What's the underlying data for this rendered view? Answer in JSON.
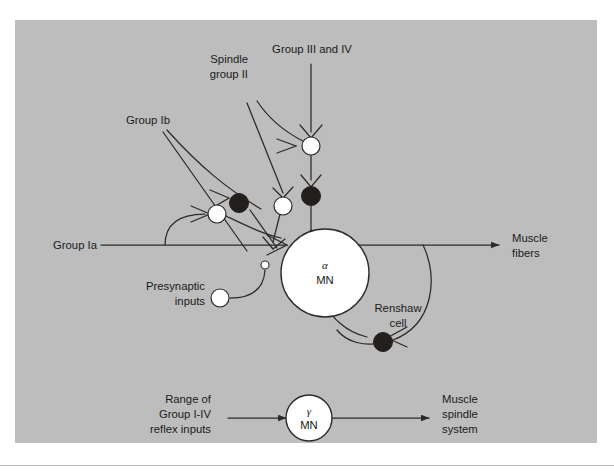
{
  "figure": {
    "panel_bg_color": "#bdbdbd",
    "page_bg_color": "#ffffff",
    "line_color": "#2b2b2b",
    "excitatory_color": "#ffffff",
    "inhibitory_color": "#231f1c"
  },
  "labels": {
    "group_ib": "Group Ib",
    "spindle_group_ii_line1": "Spindle",
    "spindle_group_ii_line2": "group II",
    "group_iii_iv": "Group III and IV",
    "group_ia": "Group Ia",
    "presynaptic_line1": "Presynaptic",
    "presynaptic_line2": "inputs",
    "muscle_fibers_line1": "Muscle",
    "muscle_fibers_line2": "fibers",
    "renshaw_line1": "Renshaw",
    "renshaw_line2": "cell",
    "range_line1": "Range of",
    "range_line2": "Group I-IV",
    "range_line3": "reflex inputs",
    "muscle_spindle_line1": "Muscle",
    "muscle_spindle_line2": "spindle",
    "muscle_spindle_line3": "system"
  },
  "somas": {
    "alpha_mn": {
      "symbol": "α",
      "name": "MN"
    },
    "gamma_mn": {
      "symbol": "γ",
      "name": "MN"
    }
  },
  "interneurons": [
    {
      "id": "in-ib-inhibitory",
      "type": "inhibitory",
      "fill": "#231f1c"
    },
    {
      "id": "in-ia-excitatory",
      "type": "excitatory",
      "fill": "#ffffff"
    },
    {
      "id": "in-spindle-ii-excitatory",
      "type": "excitatory",
      "fill": "#ffffff"
    },
    {
      "id": "in-iii-iv-excitatory",
      "type": "excitatory",
      "fill": "#ffffff"
    },
    {
      "id": "in-iii-iv-inhibitory",
      "type": "inhibitory",
      "fill": "#231f1c"
    },
    {
      "id": "in-presynaptic",
      "type": "excitatory",
      "fill": "#ffffff"
    },
    {
      "id": "in-renshaw",
      "type": "inhibitory",
      "fill": "#231f1c"
    }
  ]
}
